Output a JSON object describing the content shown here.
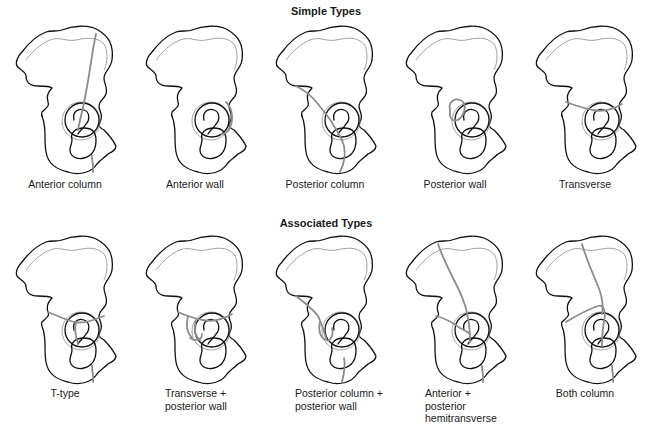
{
  "sections": [
    {
      "title": "Simple Types",
      "figures": [
        {
          "label": [
            "Anterior column"
          ],
          "fracture": "anterior-column"
        },
        {
          "label": [
            "Anterior wall"
          ],
          "fracture": "anterior-wall"
        },
        {
          "label": [
            "Posterior column"
          ],
          "fracture": "posterior-column"
        },
        {
          "label": [
            "Posterior wall"
          ],
          "fracture": "posterior-wall"
        },
        {
          "label": [
            "Transverse"
          ],
          "fracture": "transverse"
        }
      ]
    },
    {
      "title": "Associated Types",
      "figures": [
        {
          "label": [
            "T-type"
          ],
          "fracture": "t-type"
        },
        {
          "label": [
            "Transverse +",
            "posterior wall"
          ],
          "fracture": "transverse-posterior-wall"
        },
        {
          "label": [
            "Posterior column +",
            "posterior wall"
          ],
          "fracture": "posterior-column-posterior-wall"
        },
        {
          "label": [
            "Anterior +",
            "posterior",
            "hemitransverse"
          ],
          "fracture": "anterior-posterior-hemitransverse"
        },
        {
          "label": [
            "Both column"
          ],
          "fracture": "both-column"
        }
      ]
    }
  ],
  "colors": {
    "outline": "#111111",
    "fracture_line": "#8c8c8c",
    "background": "#ffffff"
  }
}
